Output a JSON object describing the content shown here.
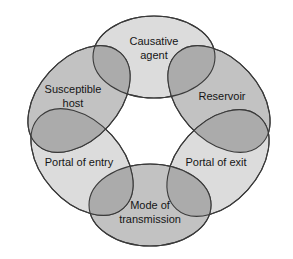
{
  "diagram": {
    "canvas": {
      "width": 293,
      "height": 259,
      "background": "#ffffff"
    },
    "colors": {
      "light_fill": "#dcdcdc",
      "medium_fill": "#c2c2c2",
      "overlap_fill": "#ababab",
      "stroke": "#3a3a3a",
      "text": "#151515",
      "background": "#ffffff"
    },
    "links": [
      {
        "id": "causative-agent",
        "label_line1": "Causative",
        "label_line2": "agent",
        "shade": "light",
        "position": "top",
        "cx": 154,
        "cy": 57,
        "rx": 61,
        "ry": 41,
        "rotation": 0,
        "text_x": 154,
        "text_y": 42
      },
      {
        "id": "reservoir",
        "label_line1": "Reservoir",
        "label_line2": "",
        "shade": "medium",
        "position": "top-right",
        "cx": 219,
        "cy": 99,
        "rx": 62,
        "ry": 40,
        "rotation": 48,
        "text_x": 222,
        "text_y": 97
      },
      {
        "id": "portal-of-exit",
        "label_line1": "Portal of exit",
        "label_line2": "",
        "shade": "light",
        "position": "bottom-right",
        "cx": 218,
        "cy": 163,
        "rx": 62,
        "ry": 40,
        "rotation": -48,
        "text_x": 216,
        "text_y": 163
      },
      {
        "id": "mode-of-transmission",
        "label_line1": "Mode of",
        "label_line2": "transmission",
        "shade": "medium",
        "position": "bottom",
        "cx": 150,
        "cy": 205,
        "rx": 61,
        "ry": 41,
        "rotation": 0,
        "text_x": 150,
        "text_y": 206
      },
      {
        "id": "portal-of-entry",
        "label_line1": "Portal of entry",
        "label_line2": "",
        "shade": "light",
        "position": "bottom-left",
        "cx": 82,
        "cy": 162,
        "rx": 62,
        "ry": 40,
        "rotation": 48,
        "text_x": 79,
        "text_y": 163
      },
      {
        "id": "susceptible-host",
        "label_line1": "Susceptible",
        "label_line2": "host",
        "shade": "medium",
        "position": "top-left",
        "cx": 79,
        "cy": 99,
        "rx": 62,
        "ry": 40,
        "rotation": -48,
        "text_x": 73,
        "text_y": 90
      }
    ],
    "overlaps": [
      {
        "id": "overlap-agent-host",
        "pair": "causative-agent+susceptible-host"
      },
      {
        "id": "overlap-agent-reservoir",
        "pair": "causative-agent+reservoir"
      },
      {
        "id": "overlap-reservoir-exit",
        "pair": "reservoir+portal-of-exit"
      },
      {
        "id": "overlap-exit-mode",
        "pair": "portal-of-exit+mode-of-transmission"
      },
      {
        "id": "overlap-mode-entry",
        "pair": "mode-of-transmission+portal-of-entry"
      },
      {
        "id": "overlap-entry-host",
        "pair": "portal-of-entry+susceptible-host"
      }
    ]
  }
}
